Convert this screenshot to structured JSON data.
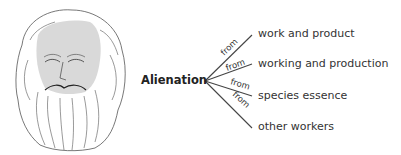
{
  "diagram": {
    "center": "Alienation",
    "connector_label": "from",
    "branches": [
      {
        "label": "work and product"
      },
      {
        "label": "working and production"
      },
      {
        "label": "species essence"
      },
      {
        "label": "other workers"
      }
    ]
  },
  "colors": {
    "line": "#444444",
    "text": "#333333",
    "face_fill": "#d9d9d9"
  }
}
